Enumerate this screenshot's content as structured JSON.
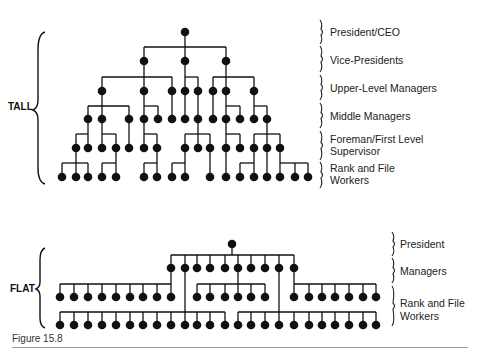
{
  "tall": {
    "label": "TALL",
    "levels": [
      {
        "name": "President/CEO",
        "y": 32
      },
      {
        "name": "Vice-Presidents",
        "y": 61
      },
      {
        "name": "Upper-Level Managers",
        "y": 91
      },
      {
        "name": "Middle Managers",
        "y": 119
      },
      {
        "name": "Foreman/First Level Supervisor",
        "y": 148
      },
      {
        "name": "Rank and File Workers",
        "y": 177
      }
    ],
    "level_labels": [
      "President/CEO",
      "Vice-Presidents",
      "Upper-Level Managers",
      "Middle Managers",
      "Foreman/First Level",
      "Supervisor",
      "Rank and File",
      "Workers"
    ]
  },
  "flat": {
    "label": "FLAT",
    "level_labels": [
      "President",
      "Managers",
      "Rank and File",
      "Workers"
    ]
  },
  "caption": "Figure 15.8",
  "colors": {
    "ink": "#111111",
    "rule": "#9a9a9a",
    "background": "#ffffff"
  }
}
